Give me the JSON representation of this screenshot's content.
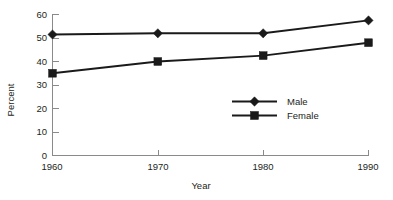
{
  "chart_data": {
    "type": "line",
    "title": "",
    "xlabel": "Year",
    "ylabel": "Percent",
    "categories": [
      "1960",
      "1970",
      "1980",
      "1990"
    ],
    "x": [
      1960,
      1970,
      1980,
      1990
    ],
    "series": [
      {
        "name": "Male",
        "marker": "diamond",
        "values": [
          51.5,
          52.0,
          52.0,
          57.5
        ]
      },
      {
        "name": "Female",
        "marker": "square",
        "values": [
          35.0,
          40.0,
          42.5,
          48.0
        ]
      }
    ],
    "ylim": [
      0,
      60
    ],
    "yticks": [
      "0",
      "10",
      "20",
      "30",
      "40",
      "50",
      "60"
    ],
    "ytick_values": [
      0,
      10,
      20,
      30,
      40,
      50,
      60
    ],
    "xticks": [
      "1960",
      "1970",
      "1980",
      "1990"
    ],
    "grid": false,
    "legend_position": "inside lower-center-right",
    "line_color": "#1a1a1a",
    "axis_color": "#8a8a8a"
  },
  "axes": {
    "y_title": "Percent",
    "x_title": "Year",
    "y_tick_labels": [
      "60",
      "50",
      "40",
      "30",
      "20",
      "10",
      "0"
    ],
    "x_tick_labels": [
      "1960",
      "1970",
      "1980",
      "1990"
    ]
  },
  "legend": {
    "entries": [
      {
        "label": "Male"
      },
      {
        "label": "Female"
      }
    ]
  },
  "ghost": {
    "cropped_title": ""
  }
}
